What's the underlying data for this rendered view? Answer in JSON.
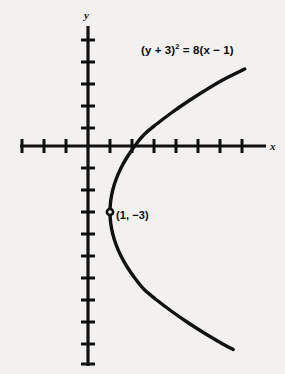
{
  "figure": {
    "width": 285,
    "height": 374,
    "background_color": "#f2f1ef",
    "ink_color": "#111111",
    "alt_text": "Graph of a rightward-opening parabola on x-y axes with vertex at (1, -3)"
  },
  "axes": {
    "x_label": "x",
    "y_label": "y",
    "origin_px": {
      "x": 88,
      "y": 146
    },
    "unit_px": 22,
    "x_axis_px": {
      "x1": 20,
      "x2": 266,
      "y": 146
    },
    "y_axis_px": {
      "y1": 26,
      "y2": 366,
      "x": 88
    },
    "x_tick_values": [
      -3,
      -2,
      -1,
      1,
      2,
      3,
      4,
      5,
      6,
      7,
      8
    ],
    "y_tick_values": [
      1,
      2,
      3,
      4,
      5,
      -1,
      -2,
      -3,
      -4,
      -5,
      -6,
      -7,
      -8,
      -9
    ],
    "grid": "off"
  },
  "labels": {
    "equation": {
      "full_text": "(y + 3)² = 8(x − 1)",
      "lhs_before_exp": "(y + 3)",
      "exponent": "2",
      "rhs": "= 8(x − 1)"
    },
    "vertex_point": "(1, −3)"
  },
  "chart_data": {
    "type": "line",
    "title": "",
    "subtitle": "",
    "xlabel": "x",
    "ylabel": "y",
    "equation": "(y + 3)^2 = 8(x - 1)",
    "curve_name": "parabola",
    "orientation": "opens-right",
    "vertex": {
      "x": 1,
      "y": -3
    },
    "focal_parameter_4p": 8,
    "focus": {
      "x": 3,
      "y": -3
    },
    "directrix": "x = -1",
    "axis_of_symmetry": "y = -3",
    "xlim": [
      -3.1,
      8.1
    ],
    "ylim": [
      -9.5,
      5.5
    ],
    "grid": false,
    "legend": "none",
    "x_ticks": [
      -3,
      -2,
      -1,
      0,
      1,
      2,
      3,
      4,
      5,
      6,
      7,
      8
    ],
    "y_ticks": [
      5,
      4,
      3,
      2,
      1,
      0,
      -1,
      -2,
      -3,
      -4,
      -5,
      -6,
      -7,
      -8,
      -9
    ],
    "markers": [
      {
        "label": "(1, −3)",
        "x": 1,
        "y": -3,
        "style": "open-circle"
      }
    ],
    "annotations": [
      {
        "text": "(y + 3)² = 8(x − 1)",
        "x": 3.4,
        "y": 4.3
      },
      {
        "text": "(1, −3)",
        "x": 1.4,
        "y": -2.8
      }
    ],
    "series": [
      {
        "name": "(y + 3)^2 = 8(x - 1)",
        "color": "#111111",
        "points": [
          {
            "x": 7.125,
            "y": 3.5
          },
          {
            "x": 6.125,
            "y": 3.0
          },
          {
            "x": 5.28125,
            "y": 2.5
          },
          {
            "x": 4.5,
            "y": 2.0
          },
          {
            "x": 3.78125,
            "y": 1.5
          },
          {
            "x": 3.125,
            "y": 1.0
          },
          {
            "x": 2.53125,
            "y": 0.5
          },
          {
            "x": 2.125,
            "y": 0.0
          },
          {
            "x": 1.78125,
            "y": -0.5
          },
          {
            "x": 1.5,
            "y": -1.0
          },
          {
            "x": 1.28125,
            "y": -1.5
          },
          {
            "x": 1.125,
            "y": -2.0
          },
          {
            "x": 1.03125,
            "y": -2.5
          },
          {
            "x": 1.0,
            "y": -3.0
          },
          {
            "x": 1.03125,
            "y": -3.5
          },
          {
            "x": 1.125,
            "y": -4.0
          },
          {
            "x": 1.28125,
            "y": -4.5
          },
          {
            "x": 1.5,
            "y": -5.0
          },
          {
            "x": 1.78125,
            "y": -5.5
          },
          {
            "x": 2.125,
            "y": -6.0
          },
          {
            "x": 2.53125,
            "y": -6.5
          },
          {
            "x": 3.125,
            "y": -7.0
          },
          {
            "x": 3.78125,
            "y": -7.5
          },
          {
            "x": 4.5,
            "y": -8.0
          },
          {
            "x": 5.28125,
            "y": -8.5
          },
          {
            "x": 6.125,
            "y": -9.0
          },
          {
            "x": 6.6,
            "y": -9.25
          }
        ]
      }
    ],
    "x_intercepts": [
      2.125
    ],
    "y_intercepts": []
  }
}
